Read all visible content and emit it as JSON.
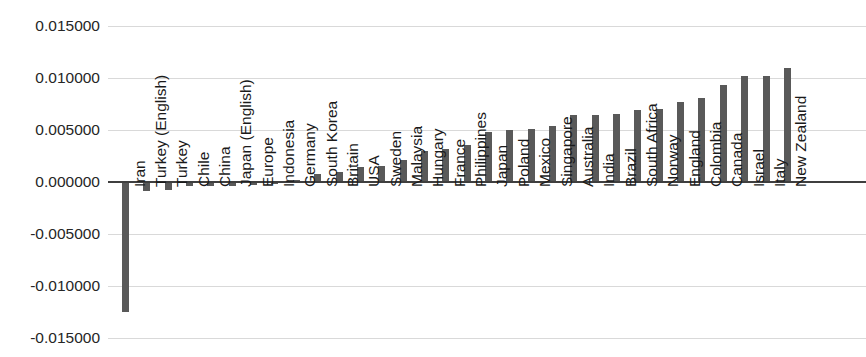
{
  "chart_data": {
    "type": "bar",
    "title": "",
    "subtitle": "",
    "xlabel": "",
    "ylabel": "",
    "ylim": [
      -0.015,
      0.015
    ],
    "grid": true,
    "legend": false,
    "legend_position": "none",
    "orientation": "vertical",
    "bar_color": "#595959",
    "axis_color": "#3f3f3f",
    "gridline_color": "#d9d9d9",
    "y_tick_labels": [
      "0.015000",
      "0.010000",
      "0.005000",
      "0.000000",
      "-0.005000",
      "-0.010000",
      "-0.015000"
    ],
    "y_ticks": [
      0.015,
      0.01,
      0.005,
      0.0,
      -0.005,
      -0.01,
      -0.015
    ],
    "categories": [
      "Iran",
      "Turkey (English)",
      "Turkey",
      "Chile",
      "China",
      "Japan (English)",
      "Europe",
      "Indonesia",
      "Germany",
      "South Korea",
      "Britain",
      "USA",
      "Sweden",
      "Malaysia",
      "Hungary",
      "France",
      "Philippines",
      "Japan",
      "Poland",
      "Mexico",
      "Singapore",
      "Australia",
      "India",
      "Brazil",
      "South Africa",
      "Norway",
      "England",
      "Colombia",
      "Canada",
      "Israel",
      "Italy",
      "New Zealand"
    ],
    "values": [
      -0.0125,
      -0.0009,
      -0.0008,
      -0.0004,
      -0.0004,
      -0.0004,
      -0.0003,
      -0.0002,
      0.0002,
      0.0008,
      0.001,
      0.0014,
      0.0015,
      0.00215,
      0.003,
      0.0032,
      0.0036,
      0.0048,
      0.005,
      0.0051,
      0.0054,
      0.0064,
      0.0064,
      0.0065,
      0.0069,
      0.007,
      0.0077,
      0.0081,
      0.0093,
      0.0102,
      0.0102,
      0.011
    ]
  }
}
